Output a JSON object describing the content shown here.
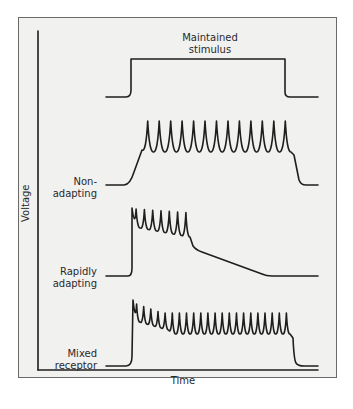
{
  "figure": {
    "type": "receptor adaptation diagram",
    "axes": {
      "x_label": "Time",
      "y_label": "Voltage"
    },
    "traces": [
      {
        "id": "stimulus",
        "label": "Maintained stimulus",
        "label_lines": [
          "Maintained",
          "stimulus"
        ],
        "description": "step: baseline, sustained plateau, return to baseline"
      },
      {
        "id": "non_adapting",
        "label": "Non-adapting",
        "label_lines": [
          "Non-",
          "adapting"
        ],
        "spike_count": 13,
        "description": "ramp up, steady spike train throughout stimulus, return to baseline"
      },
      {
        "id": "rapidly_adapting",
        "label": "Rapidly adapting",
        "label_lines": [
          "Rapidly",
          "adapting"
        ],
        "spike_count": 7,
        "description": "burst of spikes at onset, then slow decay to baseline"
      },
      {
        "id": "mixed_receptor",
        "label": "Mixed receptor",
        "label_lines": [
          "Mixed",
          "receptor"
        ],
        "spike_count": 22,
        "description": "high-frequency onset burst settling into sustained spike train"
      }
    ]
  },
  "colors": {
    "frame_bg": "#f1f1f0",
    "frame_border": "#6a6a6a",
    "trace": "#1e1e1e",
    "text": "#2a2a2a"
  }
}
